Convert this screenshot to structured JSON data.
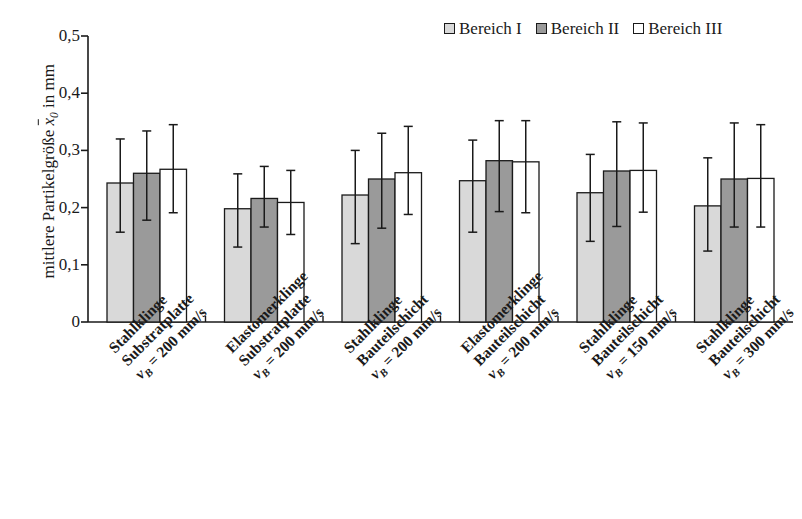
{
  "chart_data": {
    "type": "bar",
    "title": "",
    "xlabel": "",
    "ylabel": "mittlere Partikelgröße x̄₀ in mm",
    "ylim": [
      0,
      0.5
    ],
    "ytick_labels": [
      "0,5",
      "0,4",
      "0,3",
      "0,2",
      "0,1",
      "0"
    ],
    "ytick_values": [
      0.5,
      0.4,
      0.3,
      0.2,
      0.1,
      0
    ],
    "grid": false,
    "legend_position": "top-right",
    "error_bars": true,
    "categories": [
      "Stahlklinge Substratplatte vB = 200 mm/s",
      "Elastomerklinge Substratplatte vB = 200 mm/s",
      "Stahlklinge Bauteilschicht vB = 200 mm/s",
      "Elastomerklinge Bauteilschicht vB = 200 mm/s",
      "Stahlklinge Bauteilschicht vB = 150 mm/s",
      "Stahlklinge Bauteilschicht vB = 300 mm/s"
    ],
    "series": [
      {
        "name": "Bereich I",
        "color": "#d9d9d9",
        "values": [
          0.243,
          0.198,
          0.222,
          0.247,
          0.226,
          0.203
        ],
        "err_upper": [
          0.32,
          0.259,
          0.3,
          0.318,
          0.293,
          0.287
        ],
        "err_lower": [
          0.157,
          0.131,
          0.137,
          0.157,
          0.141,
          0.124
        ]
      },
      {
        "name": "Bereich II",
        "color": "#9a9a9a",
        "values": [
          0.26,
          0.216,
          0.25,
          0.282,
          0.264,
          0.25
        ],
        "err_upper": [
          0.334,
          0.272,
          0.33,
          0.352,
          0.35,
          0.348
        ],
        "err_lower": [
          0.178,
          0.166,
          0.164,
          0.193,
          0.167,
          0.166
        ]
      },
      {
        "name": "Bereich III",
        "color": "#ffffff",
        "values": [
          0.267,
          0.209,
          0.261,
          0.28,
          0.265,
          0.251
        ],
        "err_upper": [
          0.345,
          0.265,
          0.342,
          0.352,
          0.348,
          0.345
        ],
        "err_lower": [
          0.191,
          0.153,
          0.188,
          0.191,
          0.192,
          0.166
        ]
      }
    ]
  },
  "legend": {
    "entries": [
      {
        "label": "Bereich I",
        "color": "#d9d9d9"
      },
      {
        "label": "Bereich II",
        "color": "#9a9a9a"
      },
      {
        "label": "Bereich III",
        "color": "#ffffff"
      }
    ]
  },
  "y_axis": {
    "title_prefix": "mittlere Partikelgröße ",
    "title_symbol": "x",
    "title_sub": "0",
    "title_suffix": " in mm",
    "ticks": [
      "0,5",
      "0,4",
      "0,3",
      "0,2",
      "0,1",
      "0"
    ]
  },
  "x_axis": {
    "groups": [
      {
        "line1": "Stahlklinge",
        "line2": "Substratplatte",
        "vb": "v",
        "vb_sub": "B",
        "line3": " = 200 mm/s"
      },
      {
        "line1": "Elastomerklinge",
        "line2": "Substratplatte",
        "vb": "v",
        "vb_sub": "B",
        "line3": " = 200 mm/s"
      },
      {
        "line1": "Stahlklinge",
        "line2": "Bauteilschicht",
        "vb": "v",
        "vb_sub": "B",
        "line3": " = 200 mm/s"
      },
      {
        "line1": "Elastomerklinge",
        "line2": "Bauteilschicht",
        "vb": "v",
        "vb_sub": "B",
        "line3": " = 200 mm/s"
      },
      {
        "line1": "Stahlklinge",
        "line2": "Bauteilschicht",
        "vb": "v",
        "vb_sub": "B",
        "line3": " = 150 mm/s"
      },
      {
        "line1": "Stahlklinge",
        "line2": "Bauteilschicht",
        "vb": "v",
        "vb_sub": "B",
        "line3": " = 300 mm/s"
      }
    ]
  },
  "colors": {
    "axis": "#1a1a1a",
    "bar_outline": "#1a1a1a",
    "background": "#ffffff"
  }
}
